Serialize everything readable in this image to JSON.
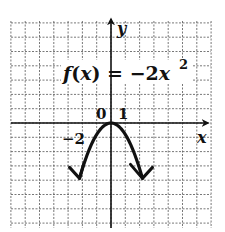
{
  "chart_data": {
    "type": "line",
    "title": "",
    "equation_label": {
      "prefix": "f(x) = ",
      "base": "−2x",
      "exponent": "2"
    },
    "function": "f(x) = -2x^2",
    "coefficient": -2,
    "xlabel": "x",
    "ylabel": "y",
    "tick_labels": {
      "origin": "0",
      "x_tick": "1",
      "y_tick": "−2"
    },
    "x_unit_per_grid": 1,
    "y_unit_per_grid": 2,
    "xlim": [
      -7,
      7
    ],
    "ylim": [
      -15,
      14
    ],
    "grid": true,
    "series": [
      {
        "name": "f(x) = -2x^2",
        "x": [
          -2.65,
          -2,
          -1.5,
          -1,
          -0.5,
          0,
          0.5,
          1,
          1.5,
          2,
          2.65
        ],
        "y": [
          -14.0,
          -8,
          -4.5,
          -2,
          -0.5,
          0,
          -0.5,
          -2,
          -4.5,
          -8,
          -14.0
        ]
      }
    ],
    "line_color": "#111111",
    "grid_color": "#555555",
    "background": "#ffffff"
  }
}
